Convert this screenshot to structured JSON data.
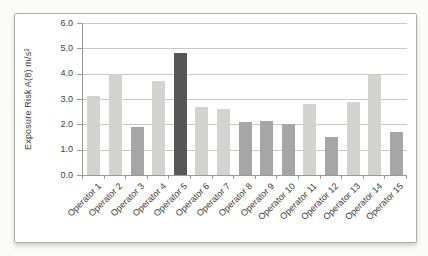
{
  "page": {
    "background": "#fbfbf8"
  },
  "chart_data": {
    "type": "bar",
    "title": "",
    "xlabel": "",
    "ylabel": "Exposure Risk A(8) m/s²",
    "categories": [
      "Operator 1",
      "Operator 2",
      "Operator 3",
      "Operator 4",
      "Operator 5",
      "Operator 6",
      "Operator 7",
      "Operator 8",
      "Operator 9",
      "Operator 10",
      "Operator 11",
      "Operator 12",
      "Operator 13",
      "Operator 14",
      "Operator 15"
    ],
    "values": [
      3.1,
      4.0,
      1.9,
      3.7,
      4.8,
      2.7,
      2.6,
      2.1,
      2.15,
      2.0,
      2.8,
      1.5,
      2.9,
      3.95,
      1.7
    ],
    "bar_color_keys": [
      "light",
      "light",
      "medium",
      "light",
      "dark",
      "light",
      "light",
      "medium",
      "medium",
      "medium",
      "light",
      "medium",
      "light",
      "light",
      "medium"
    ],
    "palette": {
      "light": "#d3d3d1",
      "medium": "#a6a6a6",
      "dark": "#565656"
    },
    "ylim": [
      0,
      6
    ],
    "ytick_step": 1,
    "yticks": [
      "6.0",
      "5.0",
      "4.0",
      "3.0",
      "2.0",
      "1.0",
      "0.0"
    ],
    "grid": true,
    "legend": null
  },
  "colors": {
    "gridline": "#c9c9c6",
    "axis": "#9a9a9a",
    "text": "#3d3d3d",
    "frame_border": "#aeaeac",
    "frame_bg": "#ffffff"
  }
}
